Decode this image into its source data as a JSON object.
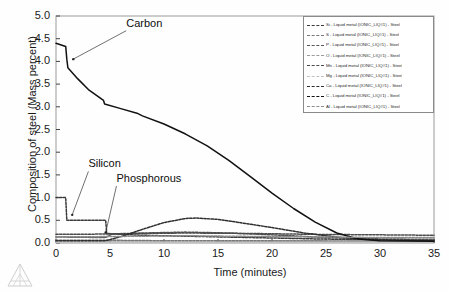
{
  "chart_data": {
    "type": "line",
    "title": "",
    "xlabel": "Time (minutes)",
    "ylabel": "Composition of steel (Mass percent)",
    "xlim": [
      0,
      35
    ],
    "ylim": [
      0.0,
      5.0
    ],
    "xticks": [
      0,
      5,
      10,
      15,
      20,
      25,
      30,
      35
    ],
    "yticks": [
      "0.0",
      "0.5",
      "1.0",
      "1.5",
      "2.0",
      "2.5",
      "3.0",
      "3.5",
      "4.0",
      "4.5",
      "5.0"
    ],
    "grid": false,
    "legend_position": "top-right",
    "annotations": [
      {
        "text": "Carbon",
        "x": 6.5,
        "y": 4.72,
        "points_to_x": 1.6,
        "points_to_y": 4.05
      },
      {
        "text": "Silicon",
        "x": 3.0,
        "y": 1.62,
        "points_to_x": 1.5,
        "points_to_y": 0.62
      },
      {
        "text": "Phosphorous",
        "x": 5.6,
        "y": 1.3,
        "points_to_x": 4.6,
        "points_to_y": 0.23
      }
    ],
    "series": [
      {
        "name": "Si - Liquid metal (IONIC_LIQ#1) - Steel",
        "element": "Si",
        "color": "#3a3a3a",
        "points": [
          [
            0,
            1.0
          ],
          [
            0.9,
            1.0
          ],
          [
            1.0,
            0.5
          ],
          [
            4.6,
            0.5
          ],
          [
            4.7,
            0.21
          ],
          [
            6.0,
            0.19
          ],
          [
            8.0,
            0.17
          ],
          [
            12.0,
            0.15
          ],
          [
            18.0,
            0.12
          ],
          [
            24.0,
            0.09
          ],
          [
            30.0,
            0.07
          ],
          [
            35.0,
            0.06
          ]
        ]
      },
      {
        "name": "S - Liquid metal (IONIC_LIQ#1) - Steel",
        "element": "S",
        "color": "#777777",
        "points": [
          [
            0,
            0.06
          ],
          [
            5,
            0.06
          ],
          [
            10,
            0.05
          ],
          [
            20,
            0.05
          ],
          [
            35,
            0.04
          ]
        ]
      },
      {
        "name": "P - Liquid metal (IONIC_LIQ#1) - Steel",
        "element": "P",
        "color": "#555555",
        "points": [
          [
            0,
            0.13
          ],
          [
            1.0,
            0.13
          ],
          [
            4.6,
            0.12
          ],
          [
            5.2,
            0.2
          ],
          [
            8,
            0.22
          ],
          [
            12,
            0.24
          ],
          [
            16,
            0.22
          ],
          [
            20,
            0.18
          ],
          [
            25,
            0.12
          ],
          [
            30,
            0.09
          ],
          [
            35,
            0.08
          ]
        ]
      },
      {
        "name": "O - Liquid metal (IONIC_LIQ#1) - Steel",
        "element": "O",
        "color": "#999999",
        "points": [
          [
            0,
            0.02
          ],
          [
            10,
            0.02
          ],
          [
            20,
            0.03
          ],
          [
            28,
            0.04
          ],
          [
            35,
            0.04
          ]
        ]
      },
      {
        "name": "Mn - Liquid metal (IONIC_LIQ#1) - Steel",
        "element": "Mn",
        "color": "#4a4a4a",
        "points": [
          [
            0,
            0.19
          ],
          [
            2,
            0.19
          ],
          [
            5,
            0.2
          ],
          [
            8,
            0.21
          ],
          [
            12,
            0.22
          ],
          [
            18,
            0.21
          ],
          [
            24,
            0.19
          ],
          [
            30,
            0.18
          ],
          [
            35,
            0.17
          ]
        ]
      },
      {
        "name": "Mg - Liquid metal (IONIC_LIQ#1) - Steel",
        "element": "Mg",
        "color": "#c2c2c2",
        "points": [
          [
            0,
            0.01
          ],
          [
            10,
            0.01
          ],
          [
            20,
            0.01
          ],
          [
            35,
            0.01
          ]
        ]
      },
      {
        "name": "Ca - Liquid metal (IONIC_LIQ#1) - Steel",
        "element": "Ca",
        "color": "#2f2f2f",
        "points": [
          [
            0,
            0.05
          ],
          [
            4.6,
            0.05
          ],
          [
            6.0,
            0.14
          ],
          [
            8,
            0.3
          ],
          [
            10,
            0.45
          ],
          [
            12,
            0.54
          ],
          [
            13,
            0.55
          ],
          [
            15,
            0.52
          ],
          [
            17,
            0.45
          ],
          [
            20,
            0.34
          ],
          [
            23,
            0.22
          ],
          [
            26,
            0.13
          ],
          [
            29,
            0.08
          ],
          [
            32,
            0.06
          ],
          [
            35,
            0.05
          ]
        ]
      },
      {
        "name": "C - Liquid metal (IONIC_LIQ#1) - Steel",
        "element": "C",
        "color": "#111111",
        "points": [
          [
            0,
            4.4
          ],
          [
            0.9,
            4.33
          ],
          [
            1.0,
            4.05
          ],
          [
            1.1,
            3.86
          ],
          [
            2.0,
            3.62
          ],
          [
            3.0,
            3.38
          ],
          [
            4.4,
            3.14
          ],
          [
            4.5,
            3.06
          ],
          [
            6.0,
            2.96
          ],
          [
            7.5,
            2.86
          ],
          [
            8.0,
            2.8
          ],
          [
            10.0,
            2.62
          ],
          [
            12.0,
            2.4
          ],
          [
            14.0,
            2.14
          ],
          [
            16.0,
            1.82
          ],
          [
            18.0,
            1.46
          ],
          [
            20.0,
            1.1
          ],
          [
            22.0,
            0.76
          ],
          [
            24.0,
            0.46
          ],
          [
            26.0,
            0.22
          ],
          [
            28.0,
            0.09
          ],
          [
            30.0,
            0.05
          ],
          [
            35.0,
            0.04
          ]
        ]
      },
      {
        "name": "Al - Liquid metal (IONIC_LIQ#1) - Steel",
        "element": "Al",
        "color": "#8c8c8c",
        "points": [
          [
            0,
            0.14
          ],
          [
            4,
            0.14
          ],
          [
            8,
            0.15
          ],
          [
            12,
            0.16
          ],
          [
            16,
            0.15
          ],
          [
            20,
            0.14
          ],
          [
            26,
            0.13
          ],
          [
            30,
            0.12
          ],
          [
            35,
            0.12
          ]
        ]
      }
    ]
  },
  "legend": {
    "entries": [
      {
        "label": "Si - Liquid metal (IONIC_LIQ#1) - Steel",
        "color": "#3a3a3a"
      },
      {
        "label": "S - Liquid metal (IONIC_LIQ#1) - Steel",
        "color": "#777777"
      },
      {
        "label": "P - Liquid metal (IONIC_LIQ#1) - Steel",
        "color": "#555555"
      },
      {
        "label": "O - Liquid metal (IONIC_LIQ#1) - Steel",
        "color": "#999999"
      },
      {
        "label": "Mn - Liquid metal (IONIC_LIQ#1) - Steel",
        "color": "#4a4a4a"
      },
      {
        "label": "Mg - Liquid metal (IONIC_LIQ#1) - Steel",
        "color": "#c2c2c2"
      },
      {
        "label": "Ca - Liquid metal (IONIC_LIQ#1) - Steel",
        "color": "#2f2f2f"
      },
      {
        "label": "C - Liquid metal (IONIC_LIQ#1) - Steel",
        "color": "#111111"
      },
      {
        "label": "Al - Liquid metal (IONIC_LIQ#1) - Steel",
        "color": "#8c8c8c"
      }
    ]
  }
}
